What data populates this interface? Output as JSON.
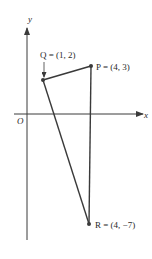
{
  "diagram": {
    "axes": {
      "x_label": "x",
      "y_label": "y",
      "origin_label": "O"
    },
    "points": [
      {
        "name": "P",
        "label": "P = (4, 3)",
        "coords": [
          4,
          3
        ]
      },
      {
        "name": "Q",
        "label": "Q = (1, 2)",
        "coords": [
          1,
          2
        ]
      },
      {
        "name": "R",
        "label": "R = (4, −7)",
        "coords": [
          4,
          -7
        ]
      }
    ],
    "segments": [
      [
        "Q",
        "P"
      ],
      [
        "P",
        "R"
      ],
      [
        "R",
        "Q"
      ]
    ],
    "colors": {
      "line": "#3a3a3a",
      "background": "#ffffff"
    }
  }
}
